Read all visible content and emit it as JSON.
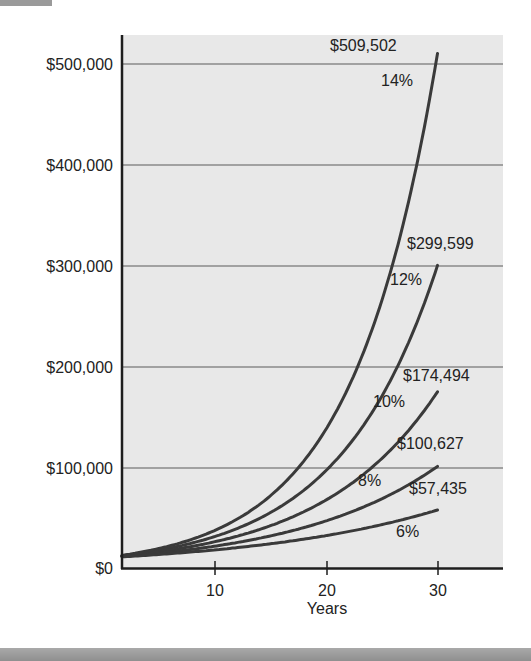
{
  "chart_data": {
    "type": "line",
    "title": "",
    "xlabel": "Years",
    "ylabel": "",
    "x_ticks": [
      10,
      20,
      30
    ],
    "y_ticks": [
      0,
      100000,
      200000,
      300000,
      400000,
      500000
    ],
    "y_tick_labels": [
      "$0",
      "$100,000",
      "$200,000",
      "$300,000",
      "$400,000",
      "$500,000"
    ],
    "xlim": [
      1.7,
      36
    ],
    "ylim": [
      0,
      530000
    ],
    "grid": "horizontal",
    "principal": 10000,
    "series": [
      {
        "name": "14%",
        "rate": 0.14,
        "end_value": 509502,
        "end_label": "$509,502"
      },
      {
        "name": "12%",
        "rate": 0.12,
        "end_value": 299599,
        "end_label": "$299,599"
      },
      {
        "name": "10%",
        "rate": 0.1,
        "end_value": 174494,
        "end_label": "$174,494"
      },
      {
        "name": "8%",
        "rate": 0.08,
        "end_value": 100627,
        "end_label": "$100,627"
      },
      {
        "name": "6%",
        "rate": 0.06,
        "end_value": 57435,
        "end_label": "$57,435"
      }
    ]
  },
  "labels": {
    "xlabel": "Years",
    "x_ticks": [
      "10",
      "20",
      "30"
    ],
    "y_ticks": [
      "$0",
      "$100,000",
      "$200,000",
      "$300,000",
      "$400,000",
      "$500,000"
    ],
    "end_values": [
      "$509,502",
      "$299,599",
      "$174,494",
      "$100,627",
      "$57,435"
    ],
    "rates": [
      "14%",
      "12%",
      "10%",
      "8%",
      "6%"
    ]
  },
  "colors": {
    "plot_background": "#e8e8e8",
    "gridline": "#8a8a8a",
    "axis": "#1e1e1e",
    "curve": "#3a3a3a"
  }
}
